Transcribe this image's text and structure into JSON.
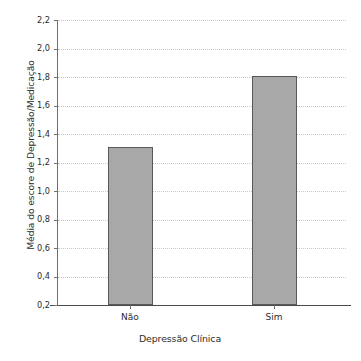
{
  "chart_data": {
    "type": "bar",
    "title": "",
    "subtitle": "",
    "xlabel": "Depressão Clínica",
    "ylabel": "Média do escore de Depressão/Medicação",
    "categories": [
      "Não",
      "Sim"
    ],
    "values": [
      1.31,
      1.81
    ],
    "value_labels": [
      "1,31",
      "1,81"
    ],
    "ylim": [
      0.2,
      2.2
    ],
    "ytick_values": [
      0.2,
      0.4,
      0.6,
      0.8,
      1.0,
      1.2,
      1.4,
      1.6,
      1.8,
      2.0,
      2.2
    ],
    "ytick_labels": [
      "0,2",
      "0,4",
      "0,6",
      "0,8",
      "1,0",
      "1,2",
      "1,4",
      "1,6",
      "1,8",
      "2,0",
      "2,2"
    ],
    "grid": true,
    "grid_axis": "y",
    "grid_style": "dotted",
    "legend": false,
    "legend_position": "none",
    "decimal_separator": ",",
    "colors": {
      "bar_fill": "#a8a8a8",
      "bar_border": "#595959",
      "gridline": "#c9c9c9",
      "axis": "#4a4a4a",
      "text": "#2b2b2b",
      "background": "#ffffff"
    }
  },
  "axes": {
    "y_title": "Média do escore de Depressão/Medicação",
    "x_title": "Depressão Clínica"
  }
}
